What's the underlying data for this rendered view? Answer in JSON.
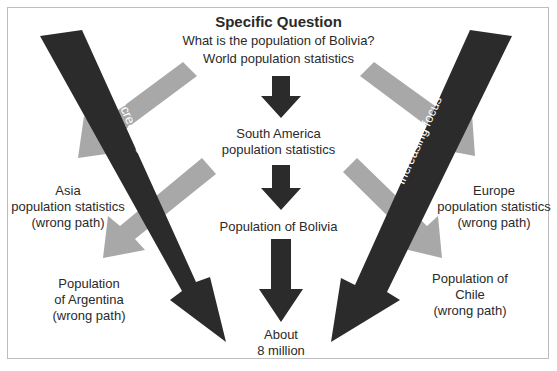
{
  "title": "Specific Question",
  "question": "What is the population of Bolivia?",
  "steps": [
    {
      "label": "World population statistics"
    },
    {
      "label": "South America population statistics",
      "lines": [
        "South America",
        "population statistics"
      ]
    },
    {
      "label": "Population of Bolivia"
    },
    {
      "label": "About 8 million",
      "lines": [
        "About",
        "8 million"
      ]
    }
  ],
  "wrong_paths": {
    "asia": {
      "lines": [
        "Asia",
        "population statistics",
        "(wrong path)"
      ]
    },
    "europe": {
      "lines": [
        "Europe",
        "population statistics",
        "(wrong path)"
      ]
    },
    "argentina": {
      "lines": [
        "Population",
        "of Argentina",
        "(wrong path)"
      ]
    },
    "chile": {
      "lines": [
        "Population of",
        "Chile",
        "(wrong path)"
      ]
    }
  },
  "focus_arrows": {
    "left_label": "Increasing focus",
    "right_label": "Increasing focus"
  },
  "colors": {
    "dark_arrow": "#2b2b2b",
    "gray_arrow": "#a8a8a8",
    "border": "#bdbdbd",
    "text": "#2a2a2a"
  }
}
